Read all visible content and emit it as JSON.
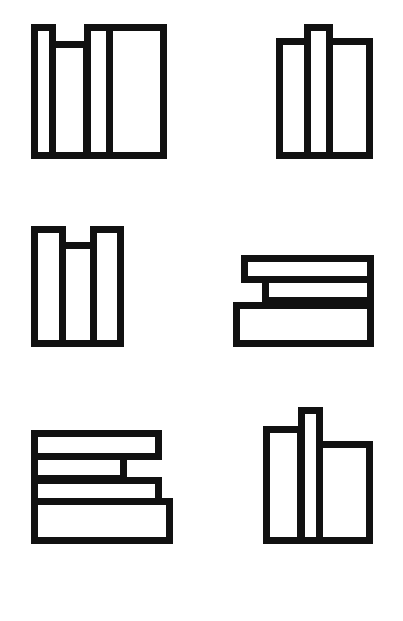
{
  "diagram": {
    "stroke_color": "#111111",
    "fill_color": "#ffffff",
    "background": "#ffffff",
    "stroke_width": 7,
    "figures": [
      {
        "id": "figure-1",
        "position": "row1-left",
        "orientation": "vertical",
        "rects": [
          {
            "x": 31,
            "y": 24,
            "w": 25,
            "h": 135
          },
          {
            "x": 49,
            "y": 41,
            "w": 41,
            "h": 118
          },
          {
            "x": 84,
            "y": 24,
            "w": 29,
            "h": 135
          },
          {
            "x": 106,
            "y": 24,
            "w": 61,
            "h": 135
          }
        ]
      },
      {
        "id": "figure-2",
        "position": "row1-right",
        "orientation": "vertical",
        "rects": [
          {
            "x": 276,
            "y": 38,
            "w": 35,
            "h": 121
          },
          {
            "x": 304,
            "y": 24,
            "w": 29,
            "h": 135
          },
          {
            "x": 326,
            "y": 38,
            "w": 47,
            "h": 121
          }
        ]
      },
      {
        "id": "figure-3",
        "position": "row2-left",
        "orientation": "vertical",
        "rects": [
          {
            "x": 31,
            "y": 226,
            "w": 35,
            "h": 121
          },
          {
            "x": 59,
            "y": 242,
            "w": 38,
            "h": 105
          },
          {
            "x": 90,
            "y": 226,
            "w": 34,
            "h": 121
          }
        ]
      },
      {
        "id": "figure-4",
        "position": "row2-right",
        "orientation": "horizontal",
        "rects": [
          {
            "x": 241,
            "y": 255,
            "w": 133,
            "h": 28
          },
          {
            "x": 262,
            "y": 276,
            "w": 112,
            "h": 28
          },
          {
            "x": 233,
            "y": 302,
            "w": 141,
            "h": 45
          }
        ]
      },
      {
        "id": "figure-5",
        "position": "row3-left",
        "orientation": "horizontal",
        "rects": [
          {
            "x": 31,
            "y": 430,
            "w": 131,
            "h": 30
          },
          {
            "x": 31,
            "y": 453,
            "w": 96,
            "h": 29
          },
          {
            "x": 31,
            "y": 477,
            "w": 131,
            "h": 28
          },
          {
            "x": 31,
            "y": 498,
            "w": 142,
            "h": 46
          }
        ]
      },
      {
        "id": "figure-6",
        "position": "row3-right",
        "orientation": "vertical",
        "rects": [
          {
            "x": 263,
            "y": 426,
            "w": 41,
            "h": 118
          },
          {
            "x": 298,
            "y": 407,
            "w": 25,
            "h": 137
          },
          {
            "x": 316,
            "y": 441,
            "w": 57,
            "h": 103
          }
        ]
      }
    ]
  }
}
